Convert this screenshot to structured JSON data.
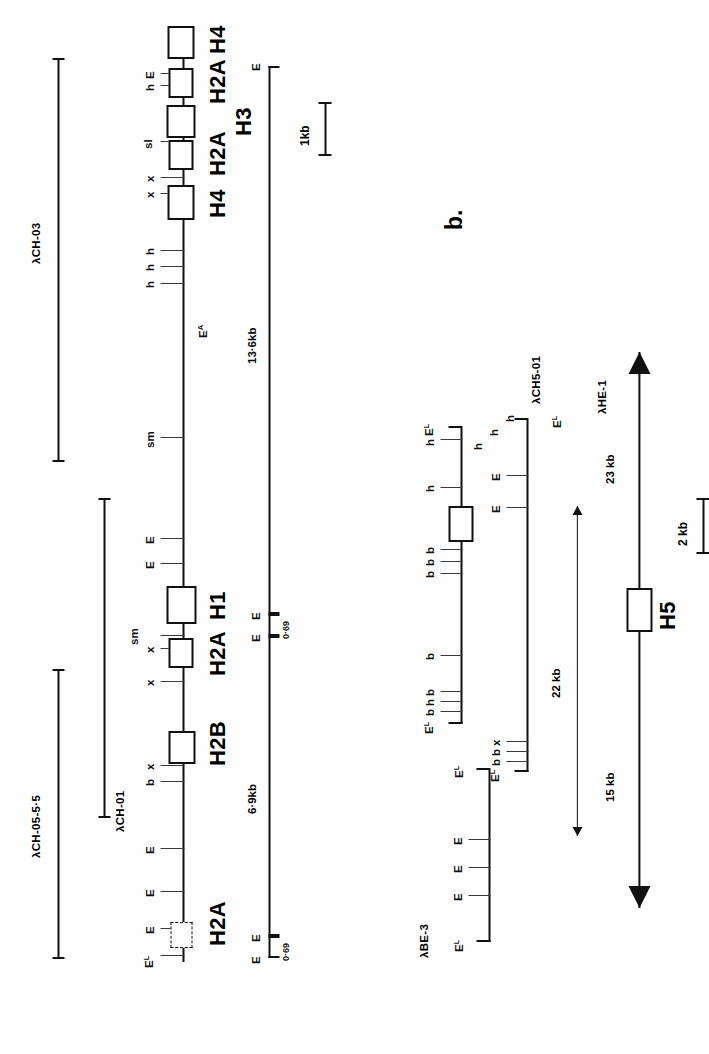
{
  "figure": {
    "panels": [
      {
        "id": "a",
        "label": ""
      },
      {
        "id": "b",
        "label": "b."
      }
    ]
  },
  "panel_a": {
    "clones": [
      {
        "name": "λCH-05-5·5"
      },
      {
        "name": "λCH-01"
      },
      {
        "name": "λCH-03"
      }
    ],
    "genes": [
      {
        "label": "H1"
      },
      {
        "label": "H4"
      },
      {
        "label": "H2A"
      },
      {
        "label": "H3"
      },
      {
        "label": "H4"
      },
      {
        "label": "H2A"
      },
      {
        "label": "H1"
      },
      {
        "label": "H2A"
      },
      {
        "label": "H2B"
      },
      {
        "label": "H2A"
      }
    ],
    "sites": [
      {
        "label": "E",
        "sup": "L"
      },
      {
        "label": "h"
      },
      {
        "label": "E"
      },
      {
        "label": "sl"
      },
      {
        "label": "x"
      },
      {
        "label": "x"
      },
      {
        "label": "h"
      },
      {
        "label": "h"
      },
      {
        "label": "h"
      },
      {
        "label": "sm"
      },
      {
        "label": "E"
      },
      {
        "label": "E"
      },
      {
        "label": "sm"
      },
      {
        "label": "x"
      },
      {
        "label": "x"
      },
      {
        "label": "x"
      },
      {
        "label": "b"
      },
      {
        "label": "E"
      },
      {
        "label": "E"
      },
      {
        "label": "E"
      },
      {
        "label": "E",
        "sup": "L"
      }
    ],
    "probe_label": {
      "text": "E",
      "sup": "A"
    },
    "fragments": [
      {
        "length": "13·6kb",
        "left_site": "E",
        "right_site": "E"
      },
      {
        "length": "0·69",
        "left_site": "E",
        "right_site": "E"
      },
      {
        "length": "6·9kb",
        "left_site": "E",
        "right_site": "E"
      },
      {
        "length": "0·69",
        "left_site": "E",
        "right_site": "E"
      }
    ],
    "scale": {
      "label": "1kb"
    }
  },
  "panel_b": {
    "label": "b.",
    "clones": [
      {
        "name": "λCH5-01"
      },
      {
        "name": "λHE-1"
      },
      {
        "name": "λBE-3"
      }
    ],
    "gene": {
      "label": "H5"
    },
    "distances": [
      {
        "label": "22 kb"
      },
      {
        "label": "15 kb"
      },
      {
        "label": "23 kb"
      }
    ],
    "ch5_01_sites": [
      {
        "label": "E",
        "sup": "L"
      },
      {
        "label": "h"
      },
      {
        "label": "h"
      },
      {
        "label": "h"
      },
      {
        "label": "h"
      },
      {
        "label": "h"
      },
      {
        "label": "h"
      },
      {
        "label": "b"
      },
      {
        "label": "b"
      },
      {
        "label": "b"
      },
      {
        "label": "b"
      },
      {
        "label": "h"
      },
      {
        "label": "b"
      },
      {
        "label": "E",
        "sup": "L"
      }
    ],
    "he_1_sites": [
      {
        "label": "E",
        "sup": "L"
      },
      {
        "label": "E"
      },
      {
        "label": "E"
      },
      {
        "label": "b"
      },
      {
        "label": "b"
      },
      {
        "label": "x"
      },
      {
        "label": "E",
        "sup": "L"
      }
    ],
    "be_3_sites": [
      {
        "label": "E",
        "sup": "L"
      },
      {
        "label": "E"
      },
      {
        "label": "E"
      },
      {
        "label": "E"
      },
      {
        "label": "E",
        "sup": "L"
      }
    ],
    "scale": {
      "label": "2 kb"
    }
  },
  "colors": {
    "ink": "#111111",
    "paper": "#ffffff",
    "tick": "#3a3a3a"
  }
}
